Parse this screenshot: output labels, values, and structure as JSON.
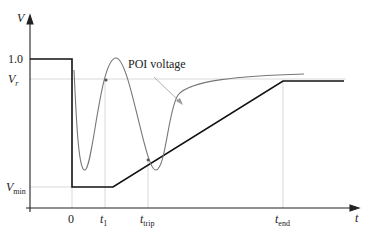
{
  "diagram": {
    "y_axis_label": "V",
    "x_axis_label": "t",
    "y_ticks": [
      {
        "label": "1.0"
      },
      {
        "label_main": "V",
        "label_sub": "r"
      },
      {
        "label_main": "V",
        "label_sub": "min"
      }
    ],
    "x_ticks": [
      {
        "label": "0"
      },
      {
        "label_main": "t",
        "label_sub": "1"
      },
      {
        "label_main": "t",
        "label_sub": "trip"
      },
      {
        "label_main": "t",
        "label_sub": "end"
      }
    ],
    "annotation": "POI voltage",
    "colors": {
      "requirement_line": "#111111",
      "poi_curve": "#777777",
      "gridline": "#cccccc"
    }
  }
}
